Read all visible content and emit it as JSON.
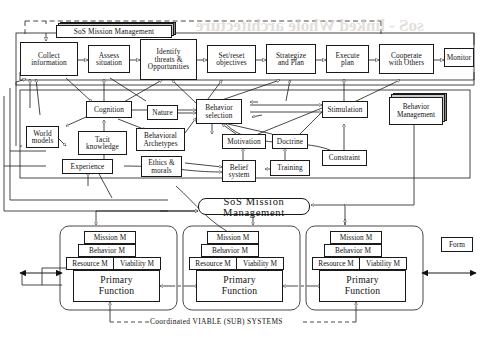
{
  "diagram": {
    "title_top": "SoS Mission Management",
    "title_bottom": "SoS Mission Management",
    "footer_caption": "Coordinated VIABLE (SUB) SYSTEMS",
    "ghost_text": "soS - linked Whole architecture"
  },
  "process_row": [
    {
      "id": "collect",
      "label": "Collect\ninformation"
    },
    {
      "id": "assess",
      "label": "Assess\nsituation"
    },
    {
      "id": "identify",
      "label": "Identify\nthreats &\nOpportunities"
    },
    {
      "id": "setreset",
      "label": "Set/reset\nobjectives"
    },
    {
      "id": "strategize",
      "label": "Strategize\nand Plan"
    },
    {
      "id": "execute",
      "label": "Execute\nplan"
    },
    {
      "id": "cooperate",
      "label": "Cooperate\nwith Others"
    },
    {
      "id": "monitor",
      "label": "Monitor"
    }
  ],
  "cognitive_nodes": [
    {
      "id": "cognition",
      "label": "Cognition"
    },
    {
      "id": "nature",
      "label": "Nature"
    },
    {
      "id": "behsel",
      "label": "Behavior\nselection"
    },
    {
      "id": "stimulation",
      "label": "Stimulation"
    },
    {
      "id": "worldmodels",
      "label": "World\nmodels"
    },
    {
      "id": "tacit",
      "label": "Tacit\nknowledge"
    },
    {
      "id": "archetypes",
      "label": "Behavioral\nArchetypes"
    },
    {
      "id": "motivation",
      "label": "Motivation"
    },
    {
      "id": "doctrine",
      "label": "Doctrine"
    },
    {
      "id": "experience",
      "label": "Experience"
    },
    {
      "id": "ethics",
      "label": "Ethics &\nmorals"
    },
    {
      "id": "belief",
      "label": "Belief\nsystem"
    },
    {
      "id": "training",
      "label": "Training"
    },
    {
      "id": "constraint",
      "label": "Constraint"
    }
  ],
  "behavior_management": {
    "label": "Behavior\nManagement"
  },
  "form_box": {
    "label": "Form"
  },
  "viable_systems": [
    {
      "id": "vs1",
      "mission": "Mission M",
      "behavior": "Behavior M",
      "resource": "Resource M",
      "viability": "Viability M",
      "primary": "Primary\nFunction"
    },
    {
      "id": "vs2",
      "mission": "Mission M",
      "behavior": "Behavior M",
      "resource": "Resource M",
      "viability": "Viability M",
      "primary": "Primary\nFunction"
    },
    {
      "id": "vs3",
      "mission": "Mission M",
      "behavior": "Behavior M",
      "resource": "Resource M",
      "viability": "Viability M",
      "primary": "Primary\nFunction"
    }
  ],
  "colors": {
    "line": "#1a1a1a",
    "paper": "#ffffff",
    "shadow_dark": "#8d8d8d",
    "shadow_light": "#c9c9c9",
    "ghost": "#d9d2cc"
  }
}
